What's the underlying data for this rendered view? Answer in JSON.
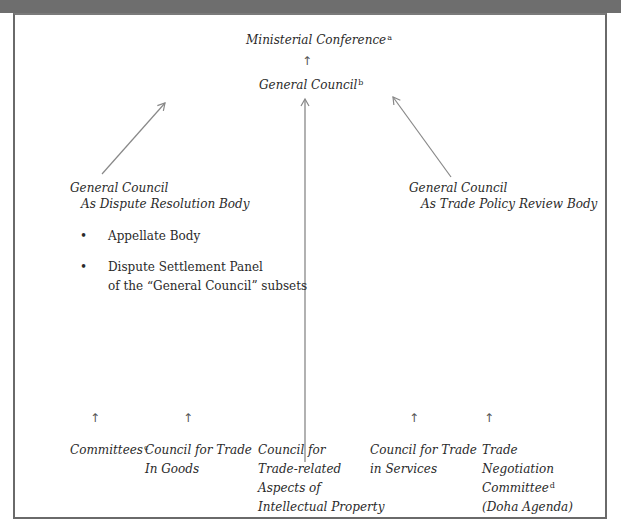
{
  "top": {
    "ministerial_conference": "Ministerial Conference",
    "ministerial_note": "a",
    "general_council": "General Council",
    "general_council_note": "b"
  },
  "left_branch": {
    "title": "General Council",
    "subtitle": "As Dispute Resolution Body",
    "bullets": [
      {
        "line1": "Appellate Body",
        "line2": ""
      },
      {
        "line1": "Dispute Settlement Panel",
        "line2": "of the “General Council” subsets"
      }
    ],
    "bullet_glyph": "•"
  },
  "right_branch": {
    "title": "General Council",
    "subtitle": "As Trade Policy Review Body"
  },
  "bottom": {
    "arrow_glyph": "↑",
    "items": [
      {
        "lines": [
          "Committees"
        ],
        "note": "c"
      },
      {
        "lines": [
          "Council for Trade",
          "In Goods"
        ],
        "note": ""
      },
      {
        "lines": [
          "Council for",
          "Trade-related",
          "Aspects of",
          "Intellectual Property"
        ],
        "note": ""
      },
      {
        "lines": [
          "Council for Trade",
          "in Services"
        ],
        "note": ""
      },
      {
        "lines": [
          "Trade",
          "Negotiation",
          "Committee",
          "(Doha Agenda)"
        ],
        "note": "d"
      }
    ]
  },
  "colors": {
    "top_band": "#6e6e6e",
    "frame_border": "#6a6a6a",
    "arrow_line": "#888888",
    "text": "#2a2a2a"
  }
}
